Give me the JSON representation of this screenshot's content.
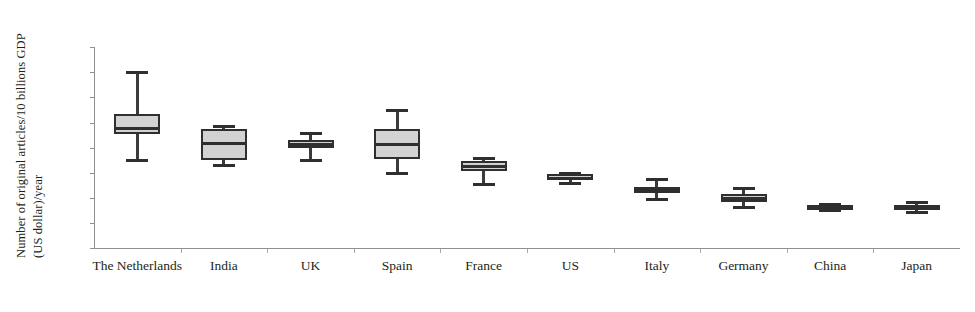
{
  "chart_data": {
    "type": "box",
    "title": "",
    "xlabel": "",
    "ylabel_line1": "Number of original articles/10 billions GDP",
    "ylabel_line2": "(US dollar)/year",
    "ylim": [
      0,
      8
    ],
    "yticks": [
      "0",
      "1",
      "2",
      "3",
      "4",
      "5",
      "6",
      "7",
      "8"
    ],
    "grid": false,
    "legend": "none",
    "categories": [
      "The Netherlands",
      "India",
      "UK",
      "Spain",
      "France",
      "US",
      "Italy",
      "Germany",
      "China",
      "Japan"
    ],
    "boxes": [
      {
        "name": "The Netherlands",
        "whisker_low": 3.5,
        "q1": 4.55,
        "median": 4.8,
        "q3": 5.35,
        "whisker_high": 7.0
      },
      {
        "name": "India",
        "whisker_low": 3.3,
        "q1": 3.5,
        "median": 4.2,
        "q3": 4.75,
        "whisker_high": 4.85
      },
      {
        "name": "UK",
        "whisker_low": 3.5,
        "q1": 4.0,
        "median": 4.15,
        "q3": 4.3,
        "whisker_high": 4.6
      },
      {
        "name": "Spain",
        "whisker_low": 3.0,
        "q1": 3.55,
        "median": 4.15,
        "q3": 4.75,
        "whisker_high": 5.5
      },
      {
        "name": "France",
        "whisker_low": 2.55,
        "q1": 3.05,
        "median": 3.25,
        "q3": 3.45,
        "whisker_high": 3.6
      },
      {
        "name": "US",
        "whisker_low": 2.6,
        "q1": 2.7,
        "median": 2.8,
        "q3": 2.95,
        "whisker_high": 3.0
      },
      {
        "name": "Italy",
        "whisker_low": 1.95,
        "q1": 2.2,
        "median": 2.3,
        "q3": 2.45,
        "whisker_high": 2.75
      },
      {
        "name": "Germany",
        "whisker_low": 1.65,
        "q1": 1.85,
        "median": 2.0,
        "q3": 2.15,
        "whisker_high": 2.4
      },
      {
        "name": "China",
        "whisker_low": 1.5,
        "q1": 1.55,
        "median": 1.6,
        "q3": 1.7,
        "whisker_high": 1.75
      },
      {
        "name": "Japan",
        "whisker_low": 1.45,
        "q1": 1.55,
        "median": 1.6,
        "q3": 1.7,
        "whisker_high": 1.85
      }
    ],
    "colors": {
      "box_fill": "#d2d2d2",
      "box_stroke": "#2f2f2f",
      "axis": "#8f8f8f",
      "text": "#231f20"
    }
  }
}
